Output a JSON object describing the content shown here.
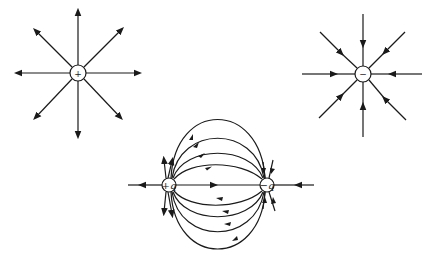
{
  "diagrams": [
    {
      "name": "positive-point-charge",
      "sign": "+",
      "center": [
        78,
        73
      ],
      "direction": "outward",
      "lines": 8
    },
    {
      "name": "negative-point-charge",
      "sign": "−",
      "center": [
        363,
        74
      ],
      "direction": "inward",
      "lines": 8
    },
    {
      "name": "electric-dipole",
      "charges": [
        {
          "label": "+q",
          "center": [
            169,
            185
          ]
        },
        {
          "label": "−q",
          "center": [
            267,
            185
          ]
        }
      ]
    }
  ],
  "labels": {
    "pos_sign": "+",
    "neg_sign": "−",
    "dipole_pos": "+q",
    "dipole_neg": "−q"
  },
  "colors": {
    "line": "#1a1a1a",
    "background": "#ffffff"
  }
}
